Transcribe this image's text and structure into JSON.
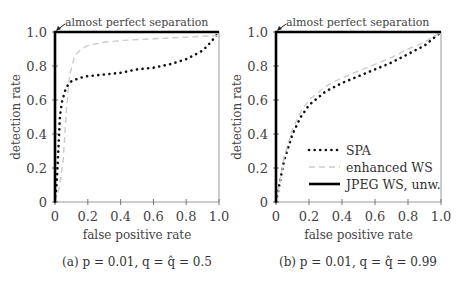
{
  "chart_data": [
    {
      "type": "line",
      "panel": "a",
      "caption": "(a) p = 0.01, q = q̂ = 0.5",
      "xlabel": "false positive rate",
      "ylabel": "detection rate",
      "xlim": [
        0,
        1
      ],
      "ylim": [
        0,
        1
      ],
      "xticks": [
        "0",
        "0.2",
        "0.4",
        "0.6",
        "0.8",
        "1.0"
      ],
      "yticks": [
        "0",
        "0.2",
        "0.4",
        "0.6",
        "0.8",
        "1.0"
      ],
      "annotation": "almost perfect separation",
      "grid": false,
      "series": [
        {
          "name": "SPA",
          "style": "dotted",
          "color": "#111111",
          "x": [
            0,
            0.01,
            0.02,
            0.03,
            0.04,
            0.06,
            0.08,
            0.1,
            0.15,
            0.2,
            0.3,
            0.4,
            0.5,
            0.6,
            0.7,
            0.8,
            0.9,
            0.95,
            1.0
          ],
          "y": [
            0,
            0.1,
            0.3,
            0.5,
            0.58,
            0.65,
            0.69,
            0.71,
            0.73,
            0.74,
            0.75,
            0.76,
            0.78,
            0.79,
            0.81,
            0.84,
            0.89,
            0.94,
            1.0
          ]
        },
        {
          "name": "enhanced WS",
          "style": "dashed",
          "color": "#cccccc",
          "x": [
            0,
            0.03,
            0.05,
            0.07,
            0.09,
            0.12,
            0.16,
            0.2,
            0.3,
            0.4,
            0.6,
            0.8,
            1.0
          ],
          "y": [
            0,
            0.1,
            0.25,
            0.55,
            0.75,
            0.86,
            0.9,
            0.92,
            0.94,
            0.95,
            0.96,
            0.97,
            0.98
          ]
        },
        {
          "name": "JPEG WS, unw.",
          "style": "solid",
          "color": "#000000",
          "x": [
            0,
            0,
            1
          ],
          "y": [
            0,
            1,
            1
          ]
        }
      ]
    },
    {
      "type": "line",
      "panel": "b",
      "caption": "(b) p = 0.01, q = q̂ = 0.99",
      "xlabel": "false positive rate",
      "ylabel": "detection rate",
      "xlim": [
        0,
        1
      ],
      "ylim": [
        0,
        1
      ],
      "xticks": [
        "0",
        "0.2",
        "0.4",
        "0.6",
        "0.8",
        "1.0"
      ],
      "yticks": [
        "0",
        "0.2",
        "0.4",
        "0.6",
        "0.8",
        "1.0"
      ],
      "annotation": "almost perfect separation",
      "legend": {
        "position": "lower right",
        "entries": [
          "SPA",
          "enhanced WS",
          "JPEG WS, unw."
        ]
      },
      "grid": false,
      "series": [
        {
          "name": "SPA",
          "style": "dotted",
          "color": "#111111",
          "x": [
            0,
            0.02,
            0.05,
            0.1,
            0.15,
            0.2,
            0.3,
            0.4,
            0.5,
            0.6,
            0.7,
            0.8,
            0.9,
            1.0
          ],
          "y": [
            0,
            0.1,
            0.25,
            0.4,
            0.5,
            0.57,
            0.65,
            0.7,
            0.74,
            0.78,
            0.82,
            0.87,
            0.92,
            1.0
          ]
        },
        {
          "name": "enhanced WS",
          "style": "dashed",
          "color": "#cccccc",
          "x": [
            0,
            0.02,
            0.05,
            0.1,
            0.15,
            0.2,
            0.3,
            0.4,
            0.5,
            0.6,
            0.7,
            0.8,
            0.9,
            1.0
          ],
          "y": [
            0,
            0.1,
            0.27,
            0.43,
            0.53,
            0.6,
            0.68,
            0.73,
            0.77,
            0.81,
            0.85,
            0.9,
            0.94,
            1.0
          ]
        },
        {
          "name": "JPEG WS, unw.",
          "style": "solid",
          "color": "#000000",
          "x": [
            0,
            0,
            1
          ],
          "y": [
            0,
            1,
            1
          ]
        }
      ]
    }
  ]
}
